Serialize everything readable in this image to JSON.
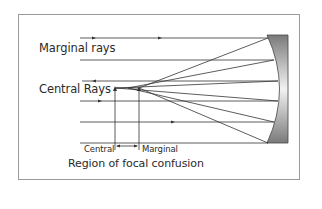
{
  "diagram": {
    "labels": {
      "marginal_rays": "Marginal rays",
      "central_rays": "Central Rays",
      "central": "Central",
      "marginal": "Marginal",
      "region": "Region of focal confusion"
    },
    "colors": {
      "line": "#333333",
      "frame": "#9a9a9a",
      "mirror_dark": "#7a7a7a",
      "mirror_light": "#f2f2f2"
    },
    "incoming_rays_y": [
      38,
      60,
      81,
      101,
      122,
      143
    ],
    "focal_points": {
      "central_x": 115,
      "marginal_x": 139,
      "y": 88
    }
  }
}
